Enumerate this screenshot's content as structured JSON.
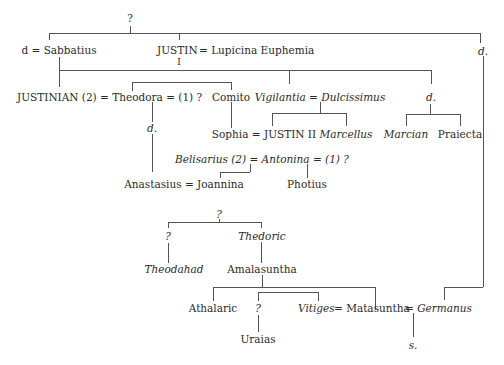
{
  "diagram": {
    "type": "family-tree",
    "colors": {
      "line": "#555555",
      "text": "#2a2a2a",
      "background": "#ffffff"
    },
    "nodes": {
      "root_unknown": "?",
      "d_sabbatius": "d = Sabbatius",
      "justin": "JUSTIN",
      "justin_numeral": "I",
      "justin_spouse": "= Lupicina Euphemia",
      "d_right": "d.",
      "justinian": "JUSTINIAN (2) = Theodora = (1) ?",
      "comito": "Comito",
      "vigilantia": "Vigilantia = Dulcissimus",
      "d_mid": "d.",
      "d_theodora": "d.",
      "sophia": "Sophia = JUSTIN II",
      "marcellus": "Marcellus",
      "marcian": "Marcian",
      "praiecta": "Praiecta",
      "belisarius": "Belisarius (2) = Antonina = (1) ?",
      "anastasius": "Anastasius = Joannina",
      "photius": "Photius",
      "goth_unknown": "?",
      "unknown_left": "?",
      "thedoric": "Thedoric",
      "theodahad": "Theodahad",
      "amalasuntha": "Amalasuntha",
      "athalaric": "Athalaric",
      "unknown_uraias_parent": "?",
      "vitiges": "Vitiges",
      "matasuntha": "= Matasuntha",
      "germanus": "= Germanus",
      "uraias": "Uraias",
      "s": "s."
    }
  }
}
